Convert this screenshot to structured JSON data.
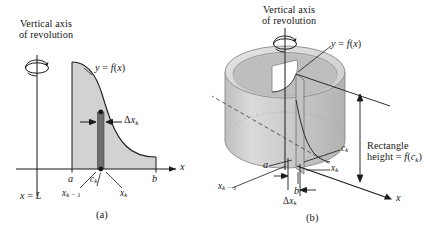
{
  "figure": {
    "kind": "math-diagram",
    "topic": "shell-method-volume-of-revolution",
    "colors": {
      "ink": "#161616",
      "region_fill": "#d2d2d2",
      "shell_fill": "#6e6e6e",
      "cylinder_body": "#c9c9c9",
      "cylinder_top": "#dcdcdc",
      "cylinder_shadow": "#b4b4b4",
      "background": "#ffffff"
    }
  },
  "panel_a": {
    "caption": "(a)",
    "axis_title_line1": "Vertical axis",
    "axis_title_line2": "of revolution",
    "curve_label_y": "y",
    "curve_label_eq": "=",
    "curve_label_f": "f",
    "curve_label_paren_open": "(",
    "curve_label_x": "x",
    "curve_label_paren_close": ")",
    "delta_label_delta": "Δ",
    "delta_label_x": "x",
    "delta_label_sub": "k",
    "x_axis_label": "x",
    "tick_a": "a",
    "tick_b": "b",
    "tick_ck_main": "c",
    "tick_ck_sub": "k",
    "tick_xk_main": "x",
    "tick_xk_sub": "k",
    "tick_xkm1_main": "x",
    "tick_xkm1_sub": "k − 1",
    "vline_label_x": "x",
    "vline_label_eq": "=",
    "vline_label_L": "L"
  },
  "panel_b": {
    "caption": "(b)",
    "axis_title_line1": "Vertical axis",
    "axis_title_line2": "of revolution",
    "curve_label_y": "y",
    "curve_label_eq": "=",
    "curve_label_f": "f",
    "curve_label_paren_open": "(",
    "curve_label_x": "x",
    "curve_label_paren_close": ")",
    "rect_label_line1": "Rectangle",
    "rect_label_line2_height": "height",
    "rect_label_line2_eq": "=",
    "rect_label_line2_f": "f",
    "rect_label_line2_open": "(",
    "rect_label_line2_c": "c",
    "rect_label_line2_sub": "k",
    "rect_label_line2_close": ")",
    "delta_label_delta": "Δ",
    "delta_label_x": "x",
    "delta_label_sub": "k",
    "x_axis_label": "x",
    "tick_a": "a",
    "tick_b": "b",
    "tick_ck_main": "c",
    "tick_ck_sub": "k",
    "tick_xk_main": "x",
    "tick_xk_sub": "k",
    "tick_xkm1_main": "x",
    "tick_xkm1_sub": "k − 1"
  }
}
